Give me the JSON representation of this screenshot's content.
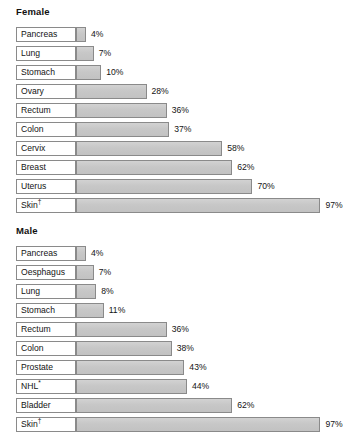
{
  "chart_data": [
    {
      "type": "bar",
      "title": "Female",
      "orientation": "horizontal",
      "xlabel": "",
      "ylabel": "",
      "xlim": [
        0,
        100
      ],
      "unit": "%",
      "grid": false,
      "legend": "none",
      "value_labels": true,
      "categories": [
        "Pancreas",
        "Lung",
        "Stomach",
        "Ovary",
        "Rectum",
        "Colon",
        "Cervix",
        "Breast",
        "Uterus",
        "Skin†"
      ],
      "values": [
        4,
        7,
        10,
        28,
        36,
        37,
        58,
        62,
        70,
        97
      ],
      "value_text": [
        "4%",
        "7%",
        "10%",
        "28%",
        "36%",
        "37%",
        "58%",
        "62%",
        "70%",
        "97%"
      ]
    },
    {
      "type": "bar",
      "title": "Male",
      "orientation": "horizontal",
      "xlabel": "",
      "ylabel": "",
      "xlim": [
        0,
        100
      ],
      "unit": "%",
      "grid": false,
      "legend": "none",
      "value_labels": true,
      "categories": [
        "Pancreas",
        "Oesphagus",
        "Lung",
        "Stomach",
        "Rectum",
        "Colon",
        "Prostate",
        "NHL*",
        "Bladder",
        "Skin†"
      ],
      "values": [
        4,
        7,
        8,
        11,
        36,
        38,
        43,
        44,
        62,
        97
      ],
      "value_text": [
        "4%",
        "7%",
        "8%",
        "11%",
        "36%",
        "38%",
        "43%",
        "44%",
        "62%",
        "97%"
      ]
    }
  ],
  "style": {
    "bar_fill": "#c9c9c9",
    "bar_border": "#8a8a8a",
    "label_bg": "#ffffff",
    "text_color": "#141414",
    "background": "#ffffff"
  },
  "geometry": {
    "bar_origin_x": 76,
    "px_per_percent": 2.52,
    "value_gap": 5
  }
}
